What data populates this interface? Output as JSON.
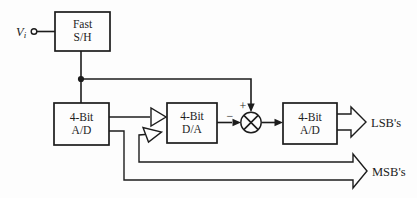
{
  "diagram": {
    "input": {
      "symbol": "V",
      "subscript": "i"
    },
    "blocks": {
      "sample_hold": {
        "line1": "Fast",
        "line2": "S/H"
      },
      "adc_coarse": {
        "line1": "4-Bit",
        "line2": "A/D"
      },
      "dac": {
        "line1": "4-Bit",
        "line2": "D/A"
      },
      "adc_fine": {
        "line1": "4-Bit",
        "line2": "A/D"
      }
    },
    "summing": {
      "plus": "+",
      "minus": "−"
    },
    "outputs": {
      "lsb": "LSB's",
      "msb": "MSB's"
    },
    "colors": {
      "line": "#1c1c1c",
      "background": "#fdfdfd",
      "box_fill": "#fdfdfd"
    }
  }
}
